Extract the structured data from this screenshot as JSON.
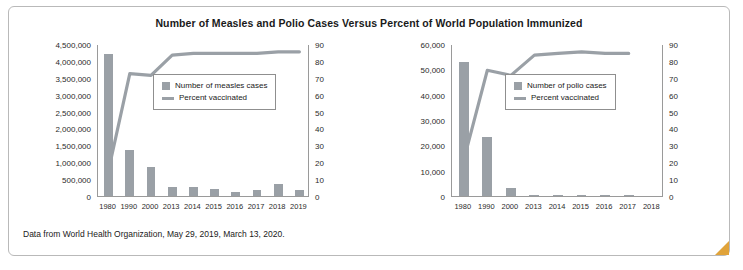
{
  "title": "Number of Measles and Polio Cases Versus Percent of  World Population Immunized",
  "caption": "Data from World Health Organization, May 29, 2019, March 13, 2020.",
  "chart_data": [
    {
      "type": "bar",
      "name": "measles-chart",
      "title": "Number of Measles and Polio Cases Versus Percent of World Population Immunized",
      "categories": [
        "1980",
        "1990",
        "2000",
        "2013",
        "2014",
        "2015",
        "2016",
        "2017",
        "2018",
        "2019"
      ],
      "xlabel": "",
      "ylabel": "",
      "ylim": [
        0,
        4500000
      ],
      "yticks": [
        "0",
        "500,000",
        "1,000,000",
        "1,500,000",
        "2,000,000",
        "2,500,000",
        "3,000,000",
        "3,500,000",
        "4,000,000",
        "4,500,000"
      ],
      "y2lim": [
        0,
        90
      ],
      "y2ticks": [
        "0",
        "10",
        "20",
        "30",
        "40",
        "50",
        "60",
        "70",
        "80",
        "90"
      ],
      "grid": false,
      "legend_position": "upper-center",
      "series": [
        {
          "name": "Number of measles cases",
          "type": "bar",
          "color": "#9aa0a6",
          "values": [
            4211431,
            1374083,
            853479,
            278358,
            267497,
            214808,
            132137,
            173330,
            353236,
            189516
          ]
        },
        {
          "name": "Percent vaccinated",
          "type": "line",
          "color": "#9aa0a6",
          "axis": "right",
          "values": [
            16,
            73,
            72,
            84,
            85,
            85,
            85,
            85,
            86,
            86
          ]
        }
      ]
    },
    {
      "type": "bar",
      "name": "polio-chart",
      "categories": [
        "1980",
        "1990",
        "2000",
        "2013",
        "2014",
        "2015",
        "2016",
        "2017",
        "2018"
      ],
      "xlabel": "",
      "ylabel": "",
      "ylim": [
        0,
        60000
      ],
      "yticks": [
        "0",
        "10,000",
        "20,000",
        "30,000",
        "40,000",
        "50,000",
        "60,000"
      ],
      "y2lim": [
        0,
        90
      ],
      "y2ticks": [
        "0",
        "10",
        "20",
        "30",
        "40",
        "50",
        "60",
        "70",
        "80",
        "90"
      ],
      "grid": false,
      "legend_position": "upper-center",
      "series": [
        {
          "name": "Number of polio cases",
          "type": "bar",
          "color": "#9aa0a6",
          "values": [
            52795,
            23484,
            2971,
            416,
            359,
            114,
            42,
            22,
            0
          ]
        },
        {
          "name": "Percent vaccinated",
          "type": "line",
          "color": "#9aa0a6",
          "axis": "right",
          "values": [
            22,
            75,
            72,
            84,
            85,
            86,
            85,
            85,
            null
          ]
        }
      ]
    }
  ],
  "legends": {
    "measles": {
      "bar": "Number of measles cases",
      "line": "Percent vaccinated"
    },
    "polio": {
      "bar": "Number of polio cases",
      "line": "Percent vaccinated"
    }
  }
}
